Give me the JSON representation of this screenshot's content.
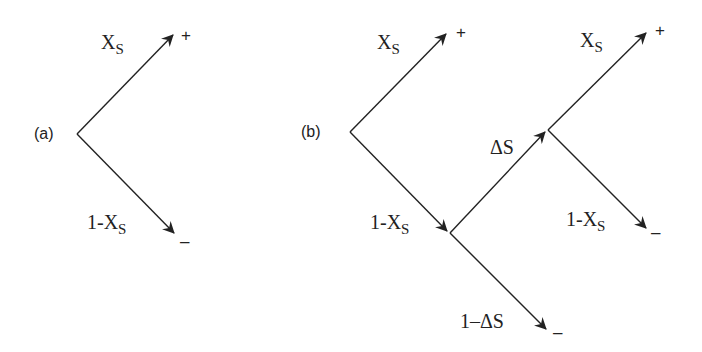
{
  "diagram": {
    "type": "probability tree",
    "panels": [
      {
        "id": "a",
        "label": "(a)",
        "branches": [
          {
            "label_main": "X",
            "label_sub": "S",
            "outcome": "+"
          },
          {
            "label_main": "1-X",
            "label_sub": "S",
            "outcome": "–"
          }
        ]
      },
      {
        "id": "b",
        "label": "(b)",
        "branches": [
          {
            "label_main": "X",
            "label_sub": "S",
            "outcome": "+"
          },
          {
            "label_main": "1-X",
            "label_sub": "S",
            "outcome": ""
          },
          {
            "label_main": "ΔS",
            "label_sub": "",
            "outcome": ""
          },
          {
            "label_main": "1–ΔS",
            "label_sub": "",
            "outcome": "–"
          },
          {
            "label_main": "X",
            "label_sub": "S",
            "outcome": "+"
          },
          {
            "label_main": "1-X",
            "label_sub": "S",
            "outcome": "–"
          }
        ]
      }
    ],
    "colors": {
      "line": "#222222",
      "background": "#ffffff"
    }
  }
}
